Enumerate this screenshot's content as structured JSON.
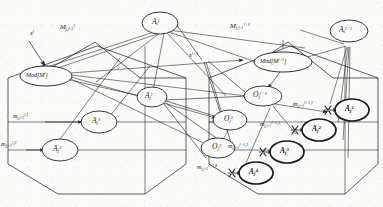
{
  "figure": {
    "kind": "node-link-diagram",
    "background_color": "#fbfbf9",
    "stroke_color": "#1a1a1a",
    "width": 383,
    "height": 207
  },
  "nodes": {
    "top_center_agent": {
      "label": "A",
      "sub": "i",
      "sup": "l",
      "bold": false
    },
    "top_right_agent": {
      "label": "A",
      "sub": "i",
      "sup": "l+1",
      "bold": false
    },
    "left_model": {
      "label": "Mod[M",
      "sup": "l",
      "tail": "]",
      "bold": false
    },
    "right_model": {
      "label": "Mod[M",
      "sup": "l+1",
      "tail": "]",
      "bold": false
    },
    "center_agent": {
      "label": "A",
      "sub": "j",
      "sup": "l",
      "bold": false
    },
    "left_a1": {
      "label": "A",
      "sub": "j",
      "sup": "1",
      "bold": false
    },
    "left_a2": {
      "label": "A",
      "sub": "j",
      "sup": "2",
      "bold": false
    },
    "obs_l1": {
      "label": "O",
      "sub": "j",
      "sup": "1",
      "bold": false
    },
    "obs_l2": {
      "label": "O",
      "sub": "j",
      "sup": "2",
      "bold": false
    },
    "obs_next": {
      "label": "O",
      "sub": "j",
      "sup": "l+1",
      "bold": false
    },
    "right_a1": {
      "label": "A",
      "sub": "j",
      "sup": "1",
      "bold": true
    },
    "right_a2": {
      "label": "A",
      "sub": "j",
      "sup": "2",
      "bold": true
    },
    "right_a3": {
      "label": "A",
      "sub": "j",
      "sup": "3",
      "bold": true
    },
    "right_a4": {
      "label": "A",
      "sub": "j",
      "sup": "4",
      "bold": true
    }
  },
  "edge_labels": {
    "s_left": {
      "label": "s",
      "sup": "l"
    },
    "s_right": {
      "label": "s",
      "sup": "l+1"
    },
    "big_m_left": {
      "label": "M",
      "sub": "j,i-1",
      "sup": "l"
    },
    "big_m_right": {
      "label": "M",
      "sub": "j,i-1",
      "sup": "l+1"
    },
    "m_left_1": {
      "label": "m",
      "sub": "j,i-1",
      "sup": "l,1"
    },
    "m_left_2": {
      "label": "m",
      "sub": "j,i-1",
      "sup": "l,2"
    },
    "m_right_1": {
      "label": "m",
      "sub": "j,i-1",
      "sup": "l+1,1"
    },
    "m_right_2": {
      "label": "m",
      "sub": "j,i-1",
      "sup": "l+1,2"
    },
    "m_right_3": {
      "label": "m",
      "sub": "j,i-1",
      "sup": "l+1,3"
    },
    "m_right_4": {
      "label": "m",
      "sub": "j,i-1",
      "sup": "l+1,4"
    }
  }
}
